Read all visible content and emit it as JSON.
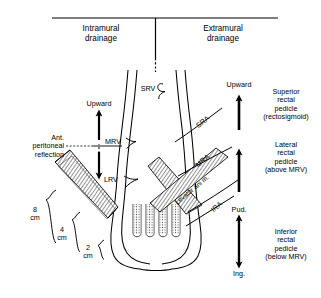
{
  "figure": {
    "title_left": "Intramural\ndrainage",
    "title_right": "Extramural\ndrainage"
  },
  "headers": {
    "intramural": "Intramural\ndrainage",
    "extramural": "Extramural\ndrainage"
  },
  "vessels": {
    "srv": "SRV",
    "mrv": "MRV",
    "lrv": "LRV",
    "sra": "SRA",
    "mra": "MRA",
    "ira": "IRA",
    "levator": "Levator ani m."
  },
  "annotations": {
    "ant_peritoneal_reflection": "Ant.\nperitoneal\nreflection",
    "upward_left": "Upward",
    "upward_right": "Upward",
    "pud": "Pud.",
    "ing": "Ing."
  },
  "measurements": {
    "eight_cm": "8\ncm",
    "four_cm": "4\ncm",
    "two_cm": "2\ncm"
  },
  "pedicles": [
    {
      "name": "superior-rectal-pedicle",
      "text": "Superior\nrectal\npedicle\n(rectosigmoid)"
    },
    {
      "name": "lateral-rectal-pedicle",
      "text": "Lateral\nrectal\npedicle\n(above MRV)"
    },
    {
      "name": "inferior-rectal-pedicle",
      "text": "Inferior\nrectal\npedicle\n(below MRV)"
    }
  ],
  "colors": {
    "ink": "#000000",
    "paper": "#ffffff",
    "hatch": "#555555"
  }
}
